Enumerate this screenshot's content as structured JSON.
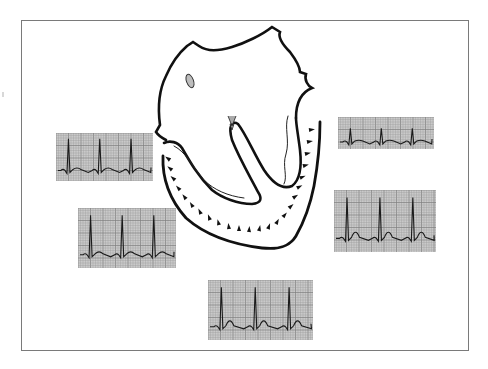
{
  "figure": {
    "title": "",
    "colors": {
      "background": "#ffffff",
      "frame": "#7a7a7a",
      "outline": "#111111",
      "grid_paper": "#c9c9c9",
      "grid_line": "#9a9a9a",
      "trace": "#1a1a1a"
    }
  },
  "heart": {
    "label": "",
    "structures": [
      "heart-outline",
      "septum-lumen",
      "valve-leaflet",
      "atrial-oval",
      "inner-endocardium",
      "injury-zone-arc",
      "injury-markers"
    ]
  },
  "ecg_strips": [
    {
      "id": "strip-top-left",
      "beats": 3,
      "st_pattern": "flat"
    },
    {
      "id": "strip-mid-left",
      "beats": 3,
      "st_pattern": "flat"
    },
    {
      "id": "strip-top-right",
      "beats": 3,
      "st_pattern": "flat-small"
    },
    {
      "id": "strip-mid-right",
      "beats": 3,
      "st_pattern": "peaked-t"
    },
    {
      "id": "strip-bottom",
      "beats": 3,
      "st_pattern": "peaked-t"
    }
  ]
}
